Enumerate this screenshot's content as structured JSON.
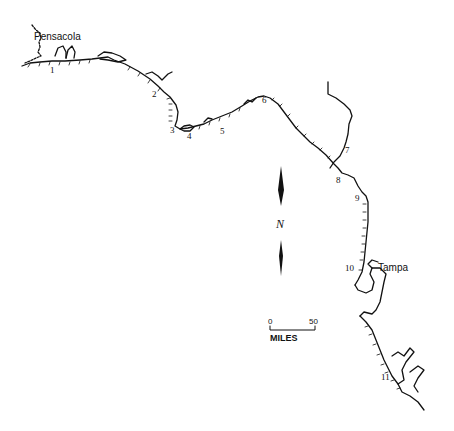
{
  "map": {
    "title": "Florida Gulf Coast",
    "cities": [
      {
        "name": "Pensacola",
        "x": 47,
        "y": 30
      },
      {
        "name": "Tampa",
        "x": 378,
        "y": 263
      }
    ],
    "sites": [
      {
        "label": "1",
        "x": 52,
        "y": 65
      },
      {
        "label": "2",
        "x": 153,
        "y": 91
      },
      {
        "label": "3",
        "x": 170,
        "y": 126
      },
      {
        "label": "4",
        "x": 187,
        "y": 134
      },
      {
        "label": "5",
        "x": 220,
        "y": 128
      },
      {
        "label": "6",
        "x": 262,
        "y": 97
      },
      {
        "label": "7",
        "x": 344,
        "y": 148
      },
      {
        "label": "8",
        "x": 336,
        "y": 176
      },
      {
        "label": "9",
        "x": 355,
        "y": 194
      },
      {
        "label": "10",
        "x": 344,
        "y": 265
      },
      {
        "label": "11",
        "x": 382,
        "y": 373
      }
    ],
    "north_arrow": {
      "label": "N"
    },
    "scale_bar": {
      "start": "0",
      "end": "50",
      "unit": "MILES"
    },
    "colors": {
      "ink": "#111111",
      "background": "#ffffff"
    }
  }
}
